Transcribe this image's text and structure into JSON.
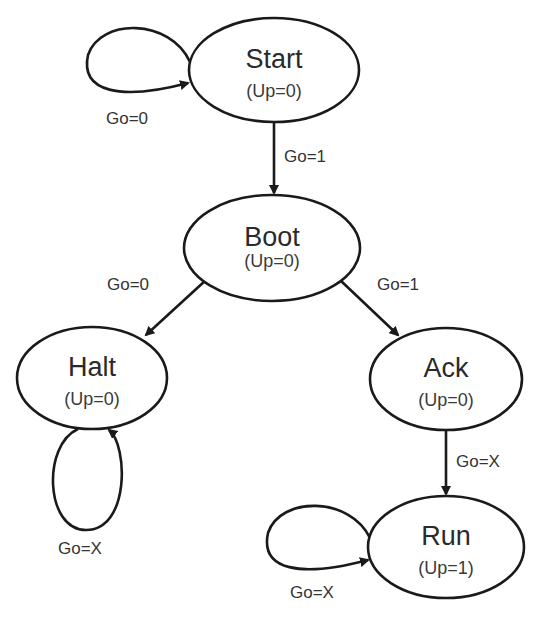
{
  "diagram": {
    "type": "finite-state-machine",
    "states": [
      {
        "id": "start",
        "name": "Start",
        "output": "(Up=0)"
      },
      {
        "id": "boot",
        "name": "Boot",
        "output": "(Up=0)"
      },
      {
        "id": "halt",
        "name": "Halt",
        "output": "(Up=0)"
      },
      {
        "id": "ack",
        "name": "Ack",
        "output": "(Up=0)"
      },
      {
        "id": "run",
        "name": "Run",
        "output": "(Up=1)"
      }
    ],
    "transitions": [
      {
        "from": "Start",
        "to": "Start",
        "label": "Go=0"
      },
      {
        "from": "Start",
        "to": "Boot",
        "label": "Go=1"
      },
      {
        "from": "Boot",
        "to": "Halt",
        "label": "Go=0"
      },
      {
        "from": "Boot",
        "to": "Ack",
        "label": "Go=1"
      },
      {
        "from": "Halt",
        "to": "Halt",
        "label": "Go=X"
      },
      {
        "from": "Ack",
        "to": "Run",
        "label": "Go=X"
      },
      {
        "from": "Run",
        "to": "Run",
        "label": "Go=X"
      }
    ]
  }
}
